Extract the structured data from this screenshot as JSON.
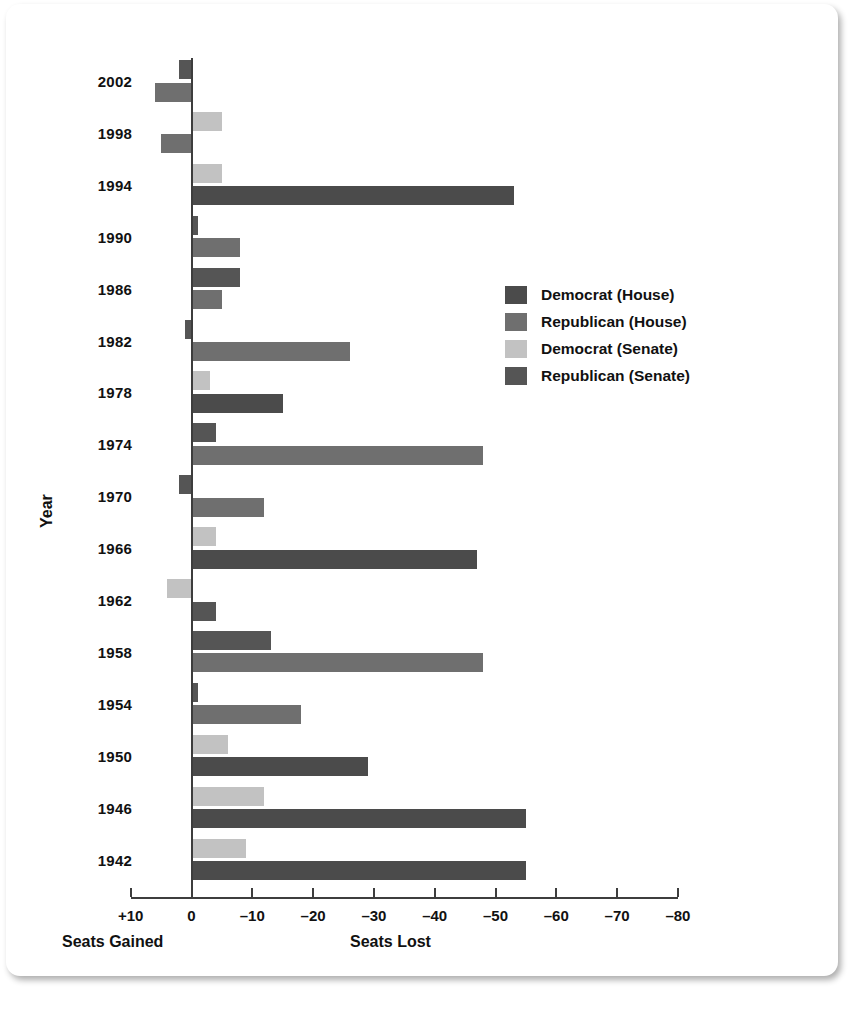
{
  "chart_data": {
    "type": "bar",
    "orientation": "horizontal",
    "title": "",
    "xlabel_left": "Seats Gained",
    "xlabel_right": "Seats Lost",
    "ylabel": "Year",
    "xlim": [
      10,
      -80
    ],
    "xticks": [
      "+10",
      "0",
      "-10",
      "-20",
      "-30",
      "-40",
      "-50",
      "-60",
      "-70",
      "-80"
    ],
    "xtick_values": [
      10,
      0,
      -10,
      -20,
      -30,
      -40,
      -50,
      -60,
      -70,
      -80
    ],
    "grid": false,
    "legend_position": "right-middle",
    "note": "Negative values are seats lost (bars extend right); positive values are seats gained (bars extend left).",
    "series": [
      {
        "name": "Democrat (House)",
        "color": "#4b4b4b",
        "key": "dem_house"
      },
      {
        "name": "Republican (House)",
        "color": "#6f6f6f",
        "key": "rep_house"
      },
      {
        "name": "Democrat (Senate)",
        "color": "#c2c2c2",
        "key": "dem_senate"
      },
      {
        "name": "Republican (Senate)",
        "color": "#555555",
        "key": "rep_senate"
      }
    ],
    "categories": [
      "2002",
      "1998",
      "1994",
      "1990",
      "1986",
      "1982",
      "1978",
      "1974",
      "1970",
      "1966",
      "1962",
      "1958",
      "1954",
      "1950",
      "1946",
      "1942"
    ],
    "rows": [
      {
        "year": "2002",
        "bars": [
          {
            "key": "rep_senate",
            "value": 2
          },
          {
            "key": "rep_house",
            "value": 6
          }
        ]
      },
      {
        "year": "1998",
        "bars": [
          {
            "key": "dem_senate",
            "value": -5
          },
          {
            "key": "rep_house",
            "value": 5
          }
        ]
      },
      {
        "year": "1994",
        "bars": [
          {
            "key": "dem_senate",
            "value": -5
          },
          {
            "key": "dem_house",
            "value": -53
          }
        ]
      },
      {
        "year": "1990",
        "bars": [
          {
            "key": "rep_senate",
            "value": -1
          },
          {
            "key": "rep_house",
            "value": -8
          }
        ]
      },
      {
        "year": "1986",
        "bars": [
          {
            "key": "rep_senate",
            "value": -8
          },
          {
            "key": "rep_house",
            "value": -5
          }
        ]
      },
      {
        "year": "1982",
        "bars": [
          {
            "key": "rep_senate",
            "value": 1
          },
          {
            "key": "rep_house",
            "value": -26
          }
        ]
      },
      {
        "year": "1978",
        "bars": [
          {
            "key": "dem_senate",
            "value": -3
          },
          {
            "key": "dem_house",
            "value": -15
          }
        ]
      },
      {
        "year": "1974",
        "bars": [
          {
            "key": "rep_senate",
            "value": -4
          },
          {
            "key": "rep_house",
            "value": -48
          }
        ]
      },
      {
        "year": "1970",
        "bars": [
          {
            "key": "rep_senate",
            "value": 2
          },
          {
            "key": "rep_house",
            "value": -12
          }
        ]
      },
      {
        "year": "1966",
        "bars": [
          {
            "key": "dem_senate",
            "value": -4
          },
          {
            "key": "dem_house",
            "value": -47
          }
        ]
      },
      {
        "year": "1962",
        "bars": [
          {
            "key": "dem_senate",
            "value": 4
          },
          {
            "key": "rep_senate",
            "value": -4
          }
        ]
      },
      {
        "year": "1958",
        "bars": [
          {
            "key": "rep_senate",
            "value": -13
          },
          {
            "key": "rep_house",
            "value": -48
          }
        ]
      },
      {
        "year": "1954",
        "bars": [
          {
            "key": "rep_senate",
            "value": -1
          },
          {
            "key": "rep_house",
            "value": -18
          }
        ]
      },
      {
        "year": "1950",
        "bars": [
          {
            "key": "dem_senate",
            "value": -6
          },
          {
            "key": "dem_house",
            "value": -29
          }
        ]
      },
      {
        "year": "1946",
        "bars": [
          {
            "key": "dem_senate",
            "value": -12
          },
          {
            "key": "dem_house",
            "value": -55
          }
        ]
      },
      {
        "year": "1942",
        "bars": [
          {
            "key": "dem_senate",
            "value": -9
          },
          {
            "key": "dem_house",
            "value": -55
          }
        ]
      }
    ]
  },
  "legend": {
    "items": [
      {
        "label": "Democrat (House)",
        "color": "#4b4b4b"
      },
      {
        "label": "Republican (House)",
        "color": "#6f6f6f"
      },
      {
        "label": "Democrat (Senate)",
        "color": "#c2c2c2"
      },
      {
        "label": "Republican (Senate)",
        "color": "#555555"
      }
    ]
  },
  "axes": {
    "y_title": "Year",
    "x_left_caption": "Seats Gained",
    "x_right_caption": "Seats Lost",
    "x_tick_labels": [
      "+10",
      "0",
      "–10",
      "–20",
      "–30",
      "–40",
      "–50",
      "–60",
      "–70",
      "–80"
    ]
  }
}
